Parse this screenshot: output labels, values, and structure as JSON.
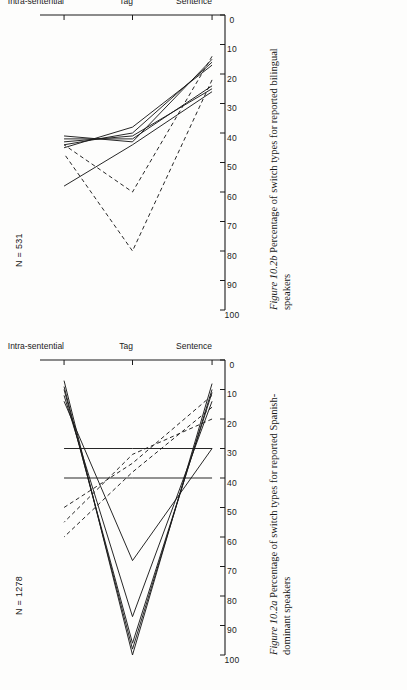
{
  "page": {
    "background_color": "#fdfdfc",
    "ink_color": "#1b1b1b"
  },
  "figures": [
    {
      "id": "figure-b",
      "caption_number": "Figure 10.2b",
      "caption_text": "Percentage of switch types for reported bilingual speakers",
      "n_label": "N = 531",
      "chart_data": {
        "type": "line",
        "title": "Percentage of switch types for reported bilingual speakers",
        "xlabel": "",
        "ylabel": "",
        "categories": [
          "Sentence",
          "Tag",
          "Intra-sentential"
        ],
        "ylim": [
          0,
          100
        ],
        "yticks": [
          0,
          10,
          20,
          30,
          40,
          50,
          60,
          70,
          80,
          90,
          100
        ],
        "grid": false,
        "legend": "none",
        "orientation": "rotated-90-ccw",
        "series": [
          {
            "name": "solid-1",
            "style": "solid",
            "values": [
              17,
              38,
              45
            ]
          },
          {
            "name": "solid-2",
            "style": "solid",
            "values": [
              16,
              40,
              44
            ]
          },
          {
            "name": "solid-3",
            "style": "solid",
            "values": [
              25,
              41,
              43
            ]
          },
          {
            "name": "solid-4",
            "style": "solid",
            "values": [
              24,
              42,
              42
            ]
          },
          {
            "name": "solid-5",
            "style": "solid",
            "values": [
              15,
              43,
              41
            ]
          },
          {
            "name": "solid-6",
            "style": "solid",
            "values": [
              26,
              44,
              58
            ]
          },
          {
            "name": "dashed-1",
            "style": "dashed",
            "values": [
              22,
              80,
              47
            ]
          },
          {
            "name": "dashed-2",
            "style": "dashed",
            "values": [
              14,
              60,
              44
            ]
          }
        ]
      }
    },
    {
      "id": "figure-a",
      "caption_number": "Figure 10.2a",
      "caption_text": "Percentage of switch types for reported Spanish-dominant speakers",
      "n_label": "N = 1278",
      "chart_data": {
        "type": "line",
        "title": "Percentage of switch types for reported Spanish-dominant speakers",
        "xlabel": "",
        "ylabel": "",
        "categories": [
          "Sentence",
          "Tag",
          "Intra-sentential"
        ],
        "ylim": [
          0,
          100
        ],
        "yticks": [
          0,
          10,
          20,
          30,
          40,
          50,
          60,
          70,
          80,
          90,
          100
        ],
        "grid": false,
        "legend": "none",
        "orientation": "rotated-90-ccw",
        "series": [
          {
            "name": "solid-1",
            "style": "solid",
            "values": [
              8,
              100,
              7
            ]
          },
          {
            "name": "solid-2",
            "style": "solid",
            "values": [
              10,
              98,
              9
            ]
          },
          {
            "name": "solid-3",
            "style": "solid",
            "values": [
              11,
              96,
              10
            ]
          },
          {
            "name": "solid-4",
            "style": "solid",
            "values": [
              14,
              87,
              12
            ]
          },
          {
            "name": "solid-5",
            "style": "solid",
            "values": [
              30,
              68,
              14
            ]
          },
          {
            "name": "solid-6",
            "style": "solid",
            "values": [
              40,
              40,
              40
            ]
          },
          {
            "name": "solid-7",
            "style": "solid",
            "values": [
              30,
              30,
              30
            ]
          },
          {
            "name": "dashed-1",
            "style": "dashed",
            "values": [
              16,
              38,
              60
            ]
          },
          {
            "name": "dashed-2",
            "style": "dashed",
            "values": [
              20,
              32,
              55
            ]
          },
          {
            "name": "dashed-3",
            "style": "dashed",
            "values": [
              12,
              35,
              50
            ]
          }
        ]
      }
    }
  ],
  "axis": {
    "tick_labels_y": [
      "100",
      "90",
      "80",
      "70",
      "60",
      "50",
      "40",
      "30",
      "20",
      "10",
      "0"
    ],
    "tick_labels_x": [
      "Sentence",
      "Tag",
      "Intra-sentential"
    ]
  }
}
